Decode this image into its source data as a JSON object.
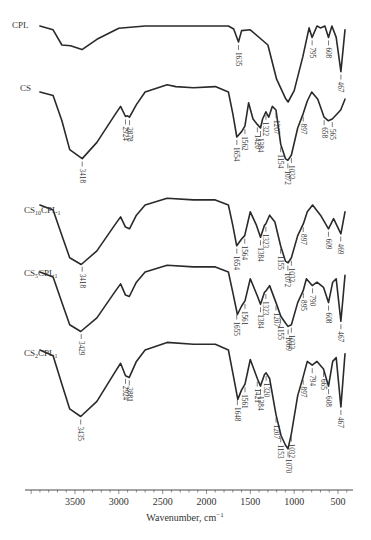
{
  "chart_data": {
    "type": "line",
    "title": "",
    "xlabel": "Wavenumber, cm⁻¹",
    "ylabel": "",
    "xlim": [
      4070,
      350
    ],
    "x_reversed": true,
    "x_ticks": [
      3500,
      3000,
      2500,
      2000,
      1500,
      1000,
      500
    ],
    "minor_tick_step": 100,
    "grid": false,
    "legend": "inline labels at left of each trace",
    "series": [
      {
        "name": "CPL",
        "peaks": [
          1635,
          795,
          608,
          467
        ],
        "points": [
          [
            3900,
            0.0
          ],
          [
            3750,
            0.1
          ],
          [
            3650,
            0.5
          ],
          [
            3550,
            0.52
          ],
          [
            3420,
            0.62
          ],
          [
            3250,
            0.35
          ],
          [
            3000,
            0.06
          ],
          [
            2700,
            0.0
          ],
          [
            2000,
            0.0
          ],
          [
            1750,
            0.0
          ],
          [
            1690,
            0.08
          ],
          [
            1635,
            0.42
          ],
          [
            1600,
            0.12
          ],
          [
            1500,
            0.1
          ],
          [
            1300,
            0.5
          ],
          [
            1200,
            1.4
          ],
          [
            1100,
            1.9
          ],
          [
            1069,
            2.0
          ],
          [
            1000,
            1.7
          ],
          [
            900,
            0.8
          ],
          [
            830,
            0.05
          ],
          [
            795,
            0.3
          ],
          [
            740,
            0.0
          ],
          [
            700,
            0.05
          ],
          [
            650,
            0.0
          ],
          [
            608,
            0.3
          ],
          [
            570,
            0.0
          ],
          [
            520,
            0.3
          ],
          [
            467,
            1.2
          ],
          [
            420,
            0.1
          ]
        ]
      },
      {
        "name": "CS",
        "peaks": [
          3418,
          2924,
          2878,
          1654,
          1562,
          1420,
          1384,
          1322,
          1207,
          1154,
          1072,
          1032,
          897,
          895,
          658,
          565
        ],
        "points": [
          [
            3900,
            0.0
          ],
          [
            3750,
            0.1
          ],
          [
            3650,
            0.8
          ],
          [
            3560,
            1.6
          ],
          [
            3418,
            1.85
          ],
          [
            3250,
            1.4
          ],
          [
            3050,
            0.65
          ],
          [
            2980,
            0.4
          ],
          [
            2924,
            0.68
          ],
          [
            2900,
            0.66
          ],
          [
            2878,
            0.7
          ],
          [
            2800,
            0.35
          ],
          [
            2700,
            0.0
          ],
          [
            2450,
            -0.2
          ],
          [
            2350,
            -0.15
          ],
          [
            2150,
            -0.12
          ],
          [
            1900,
            -0.15
          ],
          [
            1750,
            0.0
          ],
          [
            1700,
            0.6
          ],
          [
            1654,
            1.25
          ],
          [
            1600,
            1.1
          ],
          [
            1562,
            0.95
          ],
          [
            1520,
            0.3
          ],
          [
            1470,
            0.75
          ],
          [
            1420,
            0.9
          ],
          [
            1384,
            1.0
          ],
          [
            1360,
            0.75
          ],
          [
            1322,
            0.55
          ],
          [
            1290,
            0.7
          ],
          [
            1250,
            0.4
          ],
          [
            1207,
            0.5
          ],
          [
            1154,
            1.45
          ],
          [
            1100,
            1.85
          ],
          [
            1072,
            1.9
          ],
          [
            1032,
            1.75
          ],
          [
            960,
            1.0
          ],
          [
            897,
            0.6
          ],
          [
            850,
            0.25
          ],
          [
            800,
            0.0
          ],
          [
            730,
            0.2
          ],
          [
            658,
            0.7
          ],
          [
            609,
            0.8
          ],
          [
            565,
            0.75
          ],
          [
            469,
            0.5
          ],
          [
            420,
            0.2
          ]
        ]
      },
      {
        "name": "CS10CPL1",
        "peaks": [
          3418,
          1654,
          1564,
          1384,
          1323,
          1155,
          1072,
          1032,
          897,
          609,
          469
        ],
        "points": [
          [
            3900,
            0.0
          ],
          [
            3750,
            0.15
          ],
          [
            3650,
            0.9
          ],
          [
            3560,
            1.55
          ],
          [
            3429,
            1.75
          ],
          [
            3250,
            1.35
          ],
          [
            3050,
            0.6
          ],
          [
            2980,
            0.35
          ],
          [
            2924,
            0.65
          ],
          [
            2878,
            0.7
          ],
          [
            2800,
            0.3
          ],
          [
            2700,
            0.0
          ],
          [
            2450,
            -0.2
          ],
          [
            2150,
            -0.15
          ],
          [
            1900,
            -0.15
          ],
          [
            1750,
            0.0
          ],
          [
            1700,
            0.6
          ],
          [
            1655,
            1.2
          ],
          [
            1600,
            1.0
          ],
          [
            1564,
            0.9
          ],
          [
            1500,
            0.2
          ],
          [
            1430,
            0.6
          ],
          [
            1384,
            0.95
          ],
          [
            1340,
            0.6
          ],
          [
            1323,
            0.55
          ],
          [
            1280,
            0.3
          ],
          [
            1220,
            0.5
          ],
          [
            1155,
            1.2
          ],
          [
            1100,
            1.65
          ],
          [
            1069,
            1.7
          ],
          [
            1032,
            1.55
          ],
          [
            960,
            0.9
          ],
          [
            895,
            0.55
          ],
          [
            850,
            0.2
          ],
          [
            790,
            0.0
          ],
          [
            700,
            0.3
          ],
          [
            608,
            0.7
          ],
          [
            550,
            0.4
          ],
          [
            467,
            0.85
          ],
          [
            420,
            0.2
          ]
        ]
      },
      {
        "name": "CS5CPL1",
        "peaks": [
          3429,
          1655,
          1561,
          1384,
          1323,
          1207,
          1155,
          1069,
          1032,
          895,
          790,
          608,
          467
        ],
        "points": [
          [
            3900,
            0.0
          ],
          [
            3750,
            0.15
          ],
          [
            3650,
            0.9
          ],
          [
            3560,
            1.55
          ],
          [
            3435,
            1.75
          ],
          [
            3250,
            1.35
          ],
          [
            3050,
            0.6
          ],
          [
            2980,
            0.35
          ],
          [
            2924,
            0.68
          ],
          [
            2881,
            0.72
          ],
          [
            2800,
            0.3
          ],
          [
            2700,
            0.0
          ],
          [
            2450,
            -0.2
          ],
          [
            2150,
            -0.15
          ],
          [
            1900,
            -0.15
          ],
          [
            1750,
            0.0
          ],
          [
            1700,
            0.6
          ],
          [
            1648,
            1.25
          ],
          [
            1600,
            1.0
          ],
          [
            1561,
            0.85
          ],
          [
            1500,
            0.2
          ],
          [
            1421,
            0.7
          ],
          [
            1384,
            0.95
          ],
          [
            1340,
            0.6
          ],
          [
            1320,
            0.55
          ],
          [
            1280,
            0.4
          ],
          [
            1207,
            0.9
          ],
          [
            1153,
            1.3
          ],
          [
            1100,
            1.5
          ],
          [
            1069,
            1.6
          ],
          [
            1032,
            1.55
          ],
          [
            960,
            0.9
          ],
          [
            897,
            0.55
          ],
          [
            860,
            0.2
          ],
          [
            794,
            0.4
          ],
          [
            740,
            0.3
          ],
          [
            665,
            0.45
          ],
          [
            608,
            0.9
          ],
          [
            560,
            0.3
          ],
          [
            520,
            0.2
          ],
          [
            467,
            1.45
          ],
          [
            420,
            0.1
          ]
        ]
      },
      {
        "name": "CS2CPL1",
        "peaks": [
          3435,
          2924,
          2881,
          1648,
          1643,
          1561,
          1421,
          1384,
          1320,
          1207,
          1153,
          1150,
          1070,
          1069,
          1032,
          897,
          794,
          665,
          608,
          467
        ],
        "points": [
          [
            3900,
            0.0
          ],
          [
            3750,
            0.15
          ],
          [
            3650,
            0.9
          ],
          [
            3560,
            1.55
          ],
          [
            3435,
            1.75
          ],
          [
            3250,
            1.35
          ],
          [
            3050,
            0.6
          ],
          [
            2980,
            0.35
          ],
          [
            2924,
            0.68
          ],
          [
            2881,
            0.72
          ],
          [
            2800,
            0.3
          ],
          [
            2700,
            0.0
          ],
          [
            2450,
            -0.2
          ],
          [
            2150,
            -0.15
          ],
          [
            1900,
            -0.15
          ],
          [
            1750,
            0.0
          ],
          [
            1700,
            0.6
          ],
          [
            1643,
            1.3
          ],
          [
            1600,
            1.05
          ],
          [
            1561,
            0.9
          ],
          [
            1500,
            0.25
          ],
          [
            1421,
            0.75
          ],
          [
            1384,
            0.95
          ],
          [
            1340,
            0.65
          ],
          [
            1320,
            0.6
          ],
          [
            1280,
            0.75
          ],
          [
            1207,
            1.7
          ],
          [
            1150,
            2.25
          ],
          [
            1100,
            2.5
          ],
          [
            1070,
            2.6
          ],
          [
            1032,
            2.2
          ],
          [
            960,
            1.2
          ],
          [
            897,
            0.7
          ],
          [
            850,
            0.3
          ],
          [
            794,
            0.4
          ],
          [
            740,
            0.3
          ],
          [
            665,
            0.5
          ],
          [
            608,
            0.95
          ],
          [
            560,
            0.3
          ],
          [
            520,
            0.2
          ],
          [
            467,
            1.5
          ],
          [
            420,
            0.1
          ]
        ]
      }
    ]
  },
  "labels": {
    "series": [
      "CPL",
      "CS",
      "CS₁₀CPL₁",
      "CS₅CPL₁",
      "CS₂CPL₁"
    ],
    "tick_labels": [
      "3500",
      "3000",
      "2500",
      "2000",
      "1500",
      "1000",
      "500"
    ],
    "xlabel": "Wavenumber, cm⁻¹"
  }
}
